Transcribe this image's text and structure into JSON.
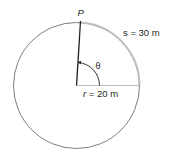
{
  "diagram": {
    "type": "circle-arc-length",
    "point_label": "P",
    "arc_label": "s = 30 m",
    "radius_label_var": "r",
    "radius_label_rest": " = 20 m",
    "angle_label": "θ",
    "colors": {
      "circle": "#6d6e71",
      "arc": "#bcbec0",
      "radius": "#231f20",
      "text": "#231f20"
    }
  }
}
